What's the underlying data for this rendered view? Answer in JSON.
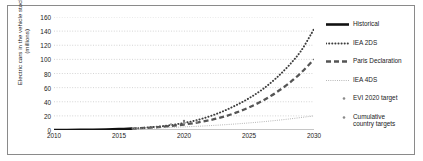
{
  "chart_data": {
    "type": "line",
    "title": "",
    "xlabel": "",
    "ylabel": "Electric cars in the vehicle stock\n(millions)",
    "xlim": [
      2010,
      2030
    ],
    "ylim": [
      0,
      160
    ],
    "xticks": [
      "2010",
      "2015",
      "2020",
      "2025",
      "2030"
    ],
    "yticks": [
      "0",
      "20",
      "40",
      "60",
      "80",
      "100",
      "120",
      "140",
      "160"
    ],
    "grid": true,
    "legend_position": "right",
    "series": [
      {
        "name": "Historical",
        "style": "solid-thick",
        "color": "#111111",
        "x": [
          2010,
          2011,
          2012,
          2013,
          2014,
          2015,
          2016
        ],
        "values": [
          0.0,
          0.06,
          0.18,
          0.41,
          0.74,
          1.26,
          2.0
        ]
      },
      {
        "name": "IEA 2DS",
        "style": "dotted",
        "color": "#3c3c3c",
        "x": [
          2016,
          2017,
          2018,
          2019,
          2020,
          2021,
          2022,
          2023,
          2024,
          2025,
          2026,
          2027,
          2028,
          2029,
          2030
        ],
        "values": [
          2.0,
          3.2,
          4.8,
          7.0,
          10.0,
          14.0,
          19.5,
          26.5,
          35.0,
          45.0,
          57.0,
          72.0,
          90.0,
          112.0,
          143.0
        ]
      },
      {
        "name": "Paris Declaration",
        "style": "dashed",
        "color": "#555555",
        "x": [
          2016,
          2017,
          2018,
          2019,
          2020,
          2021,
          2022,
          2023,
          2024,
          2025,
          2026,
          2027,
          2028,
          2029,
          2030
        ],
        "values": [
          2.0,
          2.9,
          4.1,
          5.7,
          7.8,
          10.5,
          14.0,
          18.5,
          24.5,
          32.0,
          41.0,
          52.0,
          65.0,
          81.0,
          100.0
        ]
      },
      {
        "name": "IEA 4DS",
        "style": "fine-dotted",
        "color": "#9a9a9a",
        "x": [
          2016,
          2018,
          2020,
          2022,
          2024,
          2026,
          2028,
          2030
        ],
        "values": [
          2.0,
          3.0,
          4.4,
          6.2,
          8.6,
          11.6,
          15.4,
          20.0
        ]
      }
    ],
    "markers": [
      {
        "name": "EVI 2020 target",
        "shape": "dot",
        "color": "#777777",
        "points": [
          {
            "x": 2020,
            "y": 13.0
          },
          {
            "x": 2020,
            "y": 11.0
          },
          {
            "x": 2020,
            "y": 9.0
          }
        ]
      },
      {
        "name": "Cumulative country targets",
        "shape": "dot",
        "color": "#999999",
        "points": [
          {
            "x": 2019,
            "y": 8.0
          },
          {
            "x": 2020,
            "y": 10.0
          },
          {
            "x": 2021,
            "y": 12.0
          }
        ]
      }
    ],
    "legend": [
      {
        "label": "Historical",
        "key": "solid-thick"
      },
      {
        "label": "IEA 2DS",
        "key": "dotted"
      },
      {
        "label": "Paris Declaration",
        "key": "dashed"
      },
      {
        "label": "IEA 4DS",
        "key": "fine-dotted"
      },
      {
        "label": "EVI 2020 target",
        "key": "dot-marker"
      },
      {
        "label": "Cumulative\ncountry targets",
        "key": "dot-marker"
      }
    ]
  }
}
